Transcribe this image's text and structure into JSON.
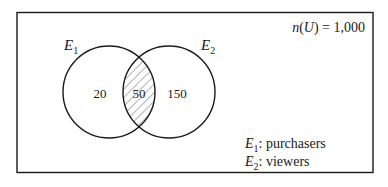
{
  "diagram": {
    "type": "venn",
    "universe": {
      "label_prefix": "n(",
      "label_var": "U",
      "label_suffix": ") = 1,000",
      "total": 1000
    },
    "sets": [
      {
        "id": "E1",
        "letter": "E",
        "sub": "1",
        "description": "purchasers"
      },
      {
        "id": "E2",
        "letter": "E",
        "sub": "2",
        "description": "viewers"
      }
    ],
    "regions": {
      "e1_only": "20",
      "intersection": "50",
      "e2_only": "150"
    },
    "shaded_region": "intersection",
    "legend": [
      {
        "letter": "E",
        "sub": "1",
        "text": ": purchasers"
      },
      {
        "letter": "E",
        "sub": "2",
        "text": ": viewers"
      }
    ]
  },
  "colors": {
    "stroke": "#1a1a1a",
    "hatch": "#555555",
    "background": "#ffffff"
  }
}
